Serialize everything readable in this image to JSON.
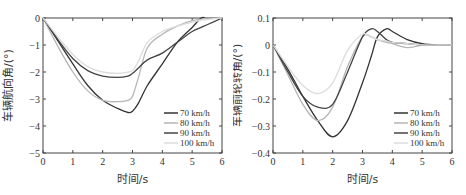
{
  "chart_data": [
    {
      "type": "line",
      "title": "",
      "xlabel": "时间/s",
      "ylabel": "车辆航向角/(°)",
      "xlim": [
        0,
        6
      ],
      "ylim": [
        -5,
        0
      ],
      "xticks": [
        0,
        1,
        2,
        3,
        4,
        5,
        6
      ],
      "yticks": [
        0,
        -1,
        -2,
        -3,
        -4,
        -5
      ],
      "grid": false,
      "legend_position": "lower right",
      "x": [
        0,
        0.5,
        1,
        1.5,
        2,
        2.5,
        2.85,
        3,
        3.2,
        3.5,
        4,
        4.5,
        5,
        5.3,
        5.5,
        6
      ],
      "series": [
        {
          "name": "70 km/h",
          "color": "#333333",
          "values": [
            0,
            -0.85,
            -1.7,
            -2.5,
            -3.05,
            -3.35,
            -3.5,
            -3.45,
            -3.15,
            -2.5,
            -1.7,
            -0.9,
            -0.35,
            0,
            0,
            0
          ]
        },
        {
          "name": "80 km/h",
          "color": "#b5b5b5",
          "values": [
            0,
            -1.05,
            -2.0,
            -2.7,
            -3.05,
            -3.1,
            -3.05,
            -2.9,
            -2.2,
            -1.1,
            -0.6,
            -0.3,
            -0.1,
            -0.05,
            0,
            0
          ]
        },
        {
          "name": "90 km/h",
          "color": "#444444",
          "values": [
            0,
            -0.8,
            -1.5,
            -1.95,
            -2.15,
            -2.2,
            -2.15,
            -2.05,
            -1.85,
            -1.55,
            -1.3,
            -0.9,
            -0.5,
            -0.35,
            -0.25,
            0
          ]
        },
        {
          "name": "100 km/h",
          "color": "#dcdcdc",
          "values": [
            0,
            -0.7,
            -1.35,
            -1.8,
            -2.0,
            -2.05,
            -2.0,
            -1.95,
            -1.6,
            -0.9,
            -0.5,
            -0.3,
            -0.15,
            -0.08,
            -0.05,
            0
          ]
        }
      ]
    },
    {
      "type": "line",
      "title": "",
      "xlabel": "时间/s",
      "ylabel": "车辆前轮转角/(°)",
      "xlim": [
        0,
        6
      ],
      "ylim": [
        -0.4,
        0.1
      ],
      "xticks": [
        0,
        1,
        2,
        3,
        4,
        5,
        6
      ],
      "yticks": [
        0.1,
        0,
        -0.1,
        -0.2,
        -0.3,
        -0.4
      ],
      "grid": false,
      "legend_position": "lower right",
      "x": [
        0,
        0.5,
        1,
        1.5,
        2,
        2.5,
        3,
        3.3,
        3.5,
        3.8,
        4,
        4.5,
        5,
        5.5,
        6
      ],
      "series": [
        {
          "name": "70 km/h",
          "color": "#333333",
          "values": [
            0,
            -0.09,
            -0.19,
            -0.28,
            -0.34,
            -0.28,
            -0.14,
            -0.04,
            0.03,
            0.06,
            0.05,
            0.02,
            0.005,
            0,
            0
          ]
        },
        {
          "name": "80 km/h",
          "color": "#b5b5b5",
          "values": [
            0,
            -0.11,
            -0.22,
            -0.28,
            -0.23,
            -0.08,
            0.03,
            0.03,
            0.02,
            0.01,
            0.005,
            -0.01,
            0,
            0,
            0
          ]
        },
        {
          "name": "90 km/h",
          "color": "#444444",
          "values": [
            0,
            -0.1,
            -0.19,
            -0.23,
            -0.22,
            -0.1,
            0.03,
            0.06,
            0.05,
            0.02,
            0.01,
            0.005,
            0,
            0,
            0
          ]
        },
        {
          "name": "100 km/h",
          "color": "#dcdcdc",
          "values": [
            0,
            -0.08,
            -0.15,
            -0.18,
            -0.14,
            -0.02,
            0.04,
            0.03,
            0.02,
            0.015,
            0.01,
            0.005,
            0,
            0,
            0
          ]
        }
      ]
    }
  ]
}
